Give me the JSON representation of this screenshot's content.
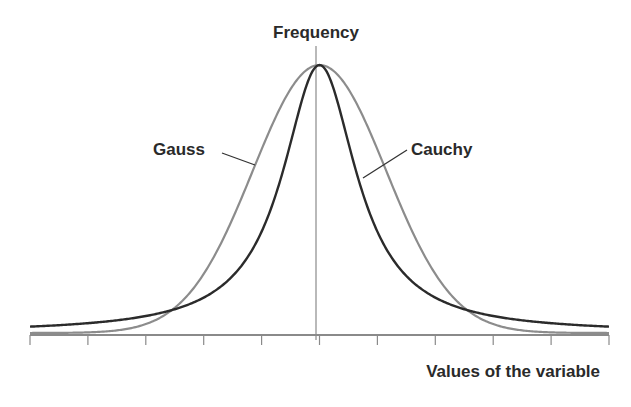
{
  "chart_data": {
    "type": "line",
    "title": "",
    "ylabel": "Frequency",
    "xlabel": "Values of the variable",
    "x_range": [
      -5,
      5
    ],
    "xticks_count": 11,
    "xtick_labels": [],
    "ytick_labels": [],
    "grid": false,
    "legend": "inline annotations with leader lines",
    "series": [
      {
        "name": "Gauss",
        "color": "#8c8c8c",
        "shape": "normal",
        "peak": 1.0,
        "sigma": 1.15,
        "x": [
          -5,
          -4,
          -3,
          -2,
          -1,
          0,
          1,
          2,
          3,
          4,
          5
        ],
        "values": [
          0.0,
          0.002,
          0.033,
          0.22,
          0.69,
          1.0,
          0.69,
          0.22,
          0.033,
          0.002,
          0.0
        ]
      },
      {
        "name": "Cauchy",
        "color": "#2b2b2b",
        "shape": "lorentzian",
        "peak": 1.0,
        "gamma": 0.78,
        "x": [
          -5,
          -4,
          -3,
          -2,
          -1,
          0,
          1,
          2,
          3,
          4,
          5
        ],
        "values": [
          0.024,
          0.037,
          0.063,
          0.132,
          0.378,
          1.0,
          0.378,
          0.132,
          0.063,
          0.037,
          0.024
        ]
      }
    ]
  },
  "labels": {
    "y_axis": "Frequency",
    "x_axis": "Values of the variable",
    "gauss": "Gauss",
    "cauchy": "Cauchy"
  },
  "colors": {
    "axis": "#8a8a8a",
    "text": "#2a2a2a"
  }
}
